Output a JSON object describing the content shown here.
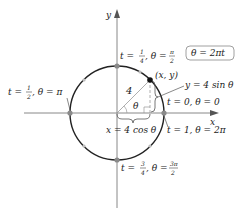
{
  "axes": {
    "x_label": "x",
    "y_label": "y"
  },
  "equation_box": "θ = 2πt",
  "radius_label": "4",
  "angle_label": "θ",
  "point_label": "(x, y)",
  "y_expr": "y = 4 sin θ",
  "x_expr": "x = 4 cos θ",
  "points": {
    "top": {
      "t": "t = ",
      "t_num": "1",
      "t_den": "4",
      "theta": ", θ = ",
      "th_num": "π",
      "th_den": "2"
    },
    "left": {
      "t": "t = ",
      "t_num": "1",
      "t_den": "2",
      "theta": ", θ = π"
    },
    "right_start": "t = 0, θ = 0",
    "right_end": "t = 1, θ = 2π",
    "bottom": {
      "t": "t = ",
      "t_num": "3",
      "t_den": "4",
      "theta": ", θ = ",
      "th_num": "3π",
      "th_den": "2"
    }
  },
  "colors": {
    "curve": "#222222",
    "axis": "#888888",
    "marker": "#8a8a8a",
    "light_marker": "#bbbbbb"
  }
}
